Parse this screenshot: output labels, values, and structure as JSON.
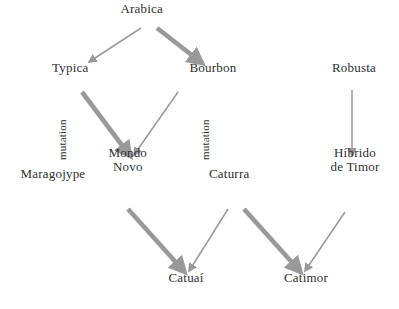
{
  "diagram": {
    "background_color": "#ffffff",
    "text_color": "#2f2f2f",
    "arrow_color": "#999999",
    "nodes": [
      {
        "id": "arabica",
        "label": "Arabica",
        "x": 142,
        "y": 16,
        "lines": [
          "Arabica"
        ]
      },
      {
        "id": "typica",
        "label": "Typica",
        "x": 70,
        "y": 75,
        "lines": [
          "Typica"
        ]
      },
      {
        "id": "bourbon",
        "label": "Bourbon",
        "x": 213,
        "y": 75,
        "lines": [
          "Bourbon"
        ]
      },
      {
        "id": "robusta",
        "label": "Robusta",
        "x": 354,
        "y": 75,
        "lines": [
          "Robusta"
        ]
      },
      {
        "id": "maragojype",
        "label": "Maragojype",
        "x": 53,
        "y": 181,
        "lines": [
          "Maragojype"
        ]
      },
      {
        "id": "mondo-novo",
        "label": "Mondo Novo",
        "x": 128,
        "y": 174,
        "lines": [
          "Mondo",
          "Novo"
        ]
      },
      {
        "id": "caturra",
        "label": "Caturra",
        "x": 229,
        "y": 181,
        "lines": [
          "Caturra"
        ]
      },
      {
        "id": "hibrido-de-timor",
        "label": "Híbrido de Timor",
        "x": 355,
        "y": 174,
        "lines": [
          "Híbrido",
          "de Timor"
        ]
      },
      {
        "id": "catuai",
        "label": "Catuaí",
        "x": 186,
        "y": 285,
        "lines": [
          "Catuaí"
        ]
      },
      {
        "id": "catimor",
        "label": "Catimor",
        "x": 306,
        "y": 285,
        "lines": [
          "Catimor"
        ]
      }
    ],
    "edge_labels": [
      {
        "id": "mutation-typica",
        "text": "mutation",
        "x": 68,
        "y": 160
      },
      {
        "id": "mutation-bourbon",
        "text": "mutation",
        "x": 211,
        "y": 160
      }
    ],
    "edges": [
      {
        "id": "arabica-to-typica",
        "from": "Arabica",
        "to": "Typica",
        "weight": "thin",
        "x1": 141,
        "y1": 28,
        "x2": 92,
        "y2": 60
      },
      {
        "id": "arabica-to-bourbon",
        "from": "Arabica",
        "to": "Bourbon",
        "weight": "thick",
        "x1": 157,
        "y1": 28,
        "x2": 198,
        "y2": 60
      },
      {
        "id": "typica-to-mondo",
        "from": "Typica",
        "to": "Mondo Novo",
        "weight": "thick",
        "x1": 82,
        "y1": 92,
        "x2": 127,
        "y2": 152
      },
      {
        "id": "bourbon-to-mondo",
        "from": "Bourbon",
        "to": "Mondo Novo",
        "weight": "thin",
        "x1": 178,
        "y1": 92,
        "x2": 136,
        "y2": 152
      },
      {
        "id": "robusta-to-hibrido",
        "from": "Robusta",
        "to": "Híbrido de Timor",
        "weight": "thin",
        "x1": 352,
        "y1": 90,
        "x2": 352,
        "y2": 152
      },
      {
        "id": "mondo-to-catuai",
        "from": "Mondo Novo",
        "to": "Catuaí",
        "weight": "thick",
        "x1": 128,
        "y1": 209,
        "x2": 181,
        "y2": 268
      },
      {
        "id": "caturra-to-catuai",
        "from": "Caturra",
        "to": "Catuaí",
        "weight": "thin",
        "x1": 228,
        "y1": 209,
        "x2": 191,
        "y2": 268
      },
      {
        "id": "caturra-to-catimor",
        "from": "Caturra",
        "to": "Catimor",
        "weight": "thick",
        "x1": 244,
        "y1": 209,
        "x2": 297,
        "y2": 268
      },
      {
        "id": "hibrido-to-catimor",
        "from": "Híbrido de Timor",
        "to": "Catimor",
        "weight": "thin",
        "x1": 345,
        "y1": 212,
        "x2": 307,
        "y2": 268
      }
    ]
  }
}
